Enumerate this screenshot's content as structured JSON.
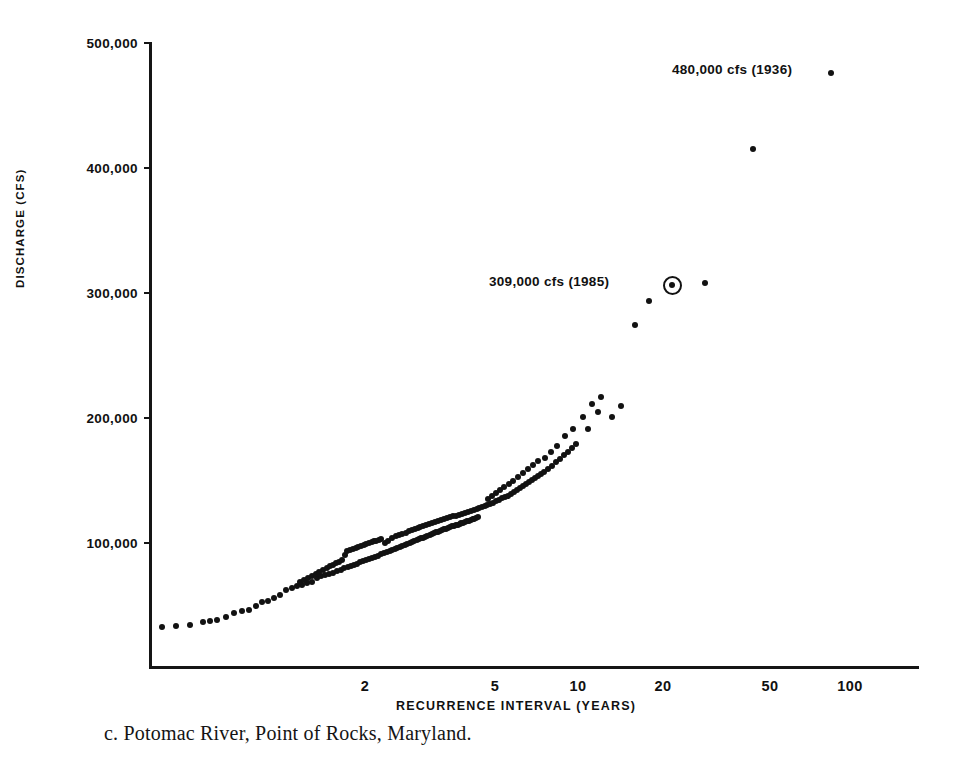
{
  "chart_data": {
    "type": "scatter",
    "title": "",
    "xlabel": "RECURRENCE INTERVAL (YEARS)",
    "ylabel": "DISCHARGE (CFS)",
    "xscale": "log-probability",
    "yscale": "linear",
    "ylim": [
      0,
      500000
    ],
    "grid": false,
    "legend": null,
    "y_ticks": [
      {
        "value": 500000,
        "label": "500,000"
      },
      {
        "value": 400000,
        "label": "400,000"
      },
      {
        "value": 300000,
        "label": "300,000"
      },
      {
        "value": 200000,
        "label": "200,000"
      },
      {
        "value": 100000,
        "label": "100,000"
      }
    ],
    "x_ticks": [
      {
        "value": 2,
        "label": "2",
        "px": 365
      },
      {
        "value": 5,
        "label": "5",
        "px": 495
      },
      {
        "value": 10,
        "label": "10",
        "px": 578
      },
      {
        "value": 20,
        "label": "20",
        "px": 663
      },
      {
        "value": 50,
        "label": "50",
        "px": 770
      },
      {
        "value": 100,
        "label": "100",
        "px": 850
      }
    ],
    "annotations": [
      {
        "id": "peak-1936",
        "text": "480,000 cfs (1936)",
        "discharge": 480000,
        "year": 1936,
        "recurrence_years": 90,
        "marker": "dot"
      },
      {
        "id": "peak-1985",
        "text": "309,000 cfs (1985)",
        "discharge": 309000,
        "year": 1985,
        "recurrence_years": 22,
        "marker": "circled-dot"
      }
    ],
    "points": [
      [
        162,
        627
      ],
      [
        176,
        626
      ],
      [
        190,
        625
      ],
      [
        203,
        622
      ],
      [
        210,
        621
      ],
      [
        217,
        620
      ],
      [
        226,
        617
      ],
      [
        234,
        613
      ],
      [
        242,
        611
      ],
      [
        249,
        610
      ],
      [
        256,
        606
      ],
      [
        262,
        602
      ],
      [
        268,
        601
      ],
      [
        274,
        598
      ],
      [
        280,
        595
      ],
      [
        286,
        590
      ],
      [
        292,
        588
      ],
      [
        297,
        586
      ],
      [
        302,
        585
      ],
      [
        307,
        583
      ],
      [
        312,
        582
      ],
      [
        317,
        578
      ],
      [
        321,
        576
      ],
      [
        325,
        575
      ],
      [
        329,
        574
      ],
      [
        333,
        573
      ],
      [
        337,
        571
      ],
      [
        341,
        570
      ],
      [
        344,
        568
      ],
      [
        348,
        567
      ],
      [
        351,
        566
      ],
      [
        354,
        565
      ],
      [
        357,
        564
      ],
      [
        360,
        562
      ],
      [
        363,
        561
      ],
      [
        366,
        560
      ],
      [
        369,
        559
      ],
      [
        372,
        558
      ],
      [
        375,
        557
      ],
      [
        378,
        556
      ],
      [
        381,
        554
      ],
      [
        384,
        553
      ],
      [
        387,
        552
      ],
      [
        390,
        551
      ],
      [
        392,
        550
      ],
      [
        395,
        549
      ],
      [
        397,
        548
      ],
      [
        400,
        547
      ],
      [
        402,
        546
      ],
      [
        405,
        545
      ],
      [
        407,
        544
      ],
      [
        410,
        543
      ],
      [
        412,
        542
      ],
      [
        414,
        541
      ],
      [
        417,
        540
      ],
      [
        419,
        539
      ],
      [
        421,
        538
      ],
      [
        423,
        538
      ],
      [
        425,
        537
      ],
      [
        427,
        536
      ],
      [
        430,
        535
      ],
      [
        432,
        534
      ],
      [
        434,
        533
      ],
      [
        436,
        532
      ],
      [
        438,
        532
      ],
      [
        440,
        531
      ],
      [
        442,
        530
      ],
      [
        444,
        529
      ],
      [
        446,
        529
      ],
      [
        448,
        528
      ],
      [
        450,
        527
      ],
      [
        452,
        526
      ],
      [
        454,
        526
      ],
      [
        456,
        525
      ],
      [
        458,
        525
      ],
      [
        460,
        524
      ],
      [
        461,
        523
      ],
      [
        463,
        523
      ],
      [
        465,
        522
      ],
      [
        467,
        521
      ],
      [
        469,
        521
      ],
      [
        471,
        520
      ],
      [
        473,
        519
      ],
      [
        474,
        519
      ],
      [
        476,
        518
      ],
      [
        478,
        517
      ],
      [
        379,
        540
      ],
      [
        381,
        539
      ],
      [
        385,
        543
      ],
      [
        388,
        541
      ],
      [
        392,
        538
      ],
      [
        396,
        536
      ],
      [
        399,
        535
      ],
      [
        402,
        534
      ],
      [
        406,
        533
      ],
      [
        409,
        531
      ],
      [
        412,
        530
      ],
      [
        415,
        529
      ],
      [
        418,
        528
      ],
      [
        420,
        527
      ],
      [
        423,
        526
      ],
      [
        426,
        525
      ],
      [
        429,
        524
      ],
      [
        432,
        523
      ],
      [
        435,
        522
      ],
      [
        438,
        521
      ],
      [
        441,
        520
      ],
      [
        444,
        519
      ],
      [
        447,
        518
      ],
      [
        450,
        517
      ],
      [
        453,
        516
      ],
      [
        456,
        516
      ],
      [
        459,
        515
      ],
      [
        462,
        514
      ],
      [
        465,
        513
      ],
      [
        468,
        512
      ],
      [
        471,
        511
      ],
      [
        474,
        510
      ],
      [
        477,
        509
      ],
      [
        479,
        508
      ],
      [
        482,
        507
      ],
      [
        485,
        506
      ],
      [
        345,
        555
      ],
      [
        347,
        551
      ],
      [
        350,
        550
      ],
      [
        353,
        549
      ],
      [
        356,
        548
      ],
      [
        358,
        547
      ],
      [
        361,
        546
      ],
      [
        364,
        545
      ],
      [
        366,
        544
      ],
      [
        369,
        543
      ],
      [
        372,
        542
      ],
      [
        374,
        541
      ],
      [
        376,
        541
      ],
      [
        323,
        570
      ],
      [
        327,
        568
      ],
      [
        330,
        566
      ],
      [
        333,
        565
      ],
      [
        336,
        563
      ],
      [
        339,
        562
      ],
      [
        342,
        560
      ],
      [
        300,
        582
      ],
      [
        304,
        580
      ],
      [
        308,
        578
      ],
      [
        312,
        576
      ],
      [
        316,
        574
      ],
      [
        319,
        572
      ],
      [
        487,
        505
      ],
      [
        490,
        504
      ],
      [
        493,
        503
      ],
      [
        496,
        501
      ],
      [
        499,
        500
      ],
      [
        502,
        498
      ],
      [
        505,
        497
      ],
      [
        508,
        496
      ],
      [
        511,
        494
      ],
      [
        514,
        492
      ],
      [
        517,
        490
      ],
      [
        520,
        488
      ],
      [
        523,
        486
      ],
      [
        526,
        484
      ],
      [
        529,
        482
      ],
      [
        532,
        480
      ],
      [
        535,
        478
      ],
      [
        538,
        476
      ],
      [
        541,
        474
      ],
      [
        544,
        472
      ],
      [
        548,
        469
      ],
      [
        552,
        466
      ],
      [
        556,
        462
      ],
      [
        560,
        459
      ],
      [
        564,
        455
      ],
      [
        568,
        452
      ],
      [
        572,
        448
      ],
      [
        576,
        444
      ],
      [
        488,
        499
      ],
      [
        492,
        496
      ],
      [
        496,
        493
      ],
      [
        500,
        490
      ],
      [
        504,
        487
      ],
      [
        509,
        484
      ],
      [
        513,
        481
      ],
      [
        518,
        477
      ],
      [
        523,
        473
      ],
      [
        528,
        469
      ],
      [
        533,
        465
      ],
      [
        538,
        461
      ],
      [
        545,
        458
      ],
      [
        551,
        452
      ],
      [
        557,
        446
      ],
      [
        565,
        436
      ],
      [
        573,
        429
      ],
      [
        583,
        417
      ],
      [
        592,
        404
      ],
      [
        601,
        397
      ],
      [
        612,
        417
      ],
      [
        621,
        406
      ],
      [
        588,
        429
      ],
      [
        598,
        412
      ],
      [
        635,
        325
      ],
      [
        649,
        301
      ],
      [
        672,
        285
      ],
      [
        705,
        283
      ],
      [
        753,
        149
      ],
      [
        831,
        73
      ]
    ]
  },
  "caption": {
    "text": "c.  Potomac River, Point of Rocks, Maryland."
  }
}
